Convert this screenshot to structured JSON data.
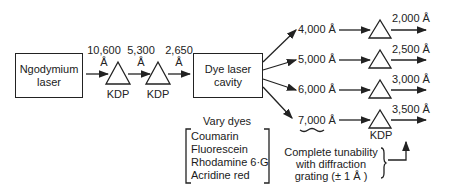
{
  "source": {
    "label_line1": "Ngodymium",
    "label_line2": "laser"
  },
  "chain": {
    "wavelengths": [
      {
        "value": "10,600",
        "unit": "Å"
      },
      {
        "value": "5,300",
        "unit": "Å"
      },
      {
        "value": "2,650",
        "unit": "Å"
      }
    ],
    "crystals": [
      "KDP",
      "KDP"
    ]
  },
  "dye_cavity": {
    "label_line1": "Dye laser",
    "label_line2": "cavity"
  },
  "dyes": {
    "title": "Vary dyes",
    "items": [
      "Coumarin",
      "Fluorescein",
      "Rhodamine 6·G",
      "Acridine red"
    ]
  },
  "outputs": [
    {
      "input": "4,000 Å",
      "output": "2,000 Å"
    },
    {
      "input": "5,000 Å",
      "output": "2,500 Å"
    },
    {
      "input": "6,000 Å",
      "output": "3,000 Å"
    },
    {
      "input": "7,000 Å",
      "output": "3,500 Å"
    }
  ],
  "output_crystal": "KDP",
  "tunability_note": {
    "line1": "Complete tunability",
    "line2": "with diffraction",
    "line3": "grating (± 1 Å )"
  }
}
